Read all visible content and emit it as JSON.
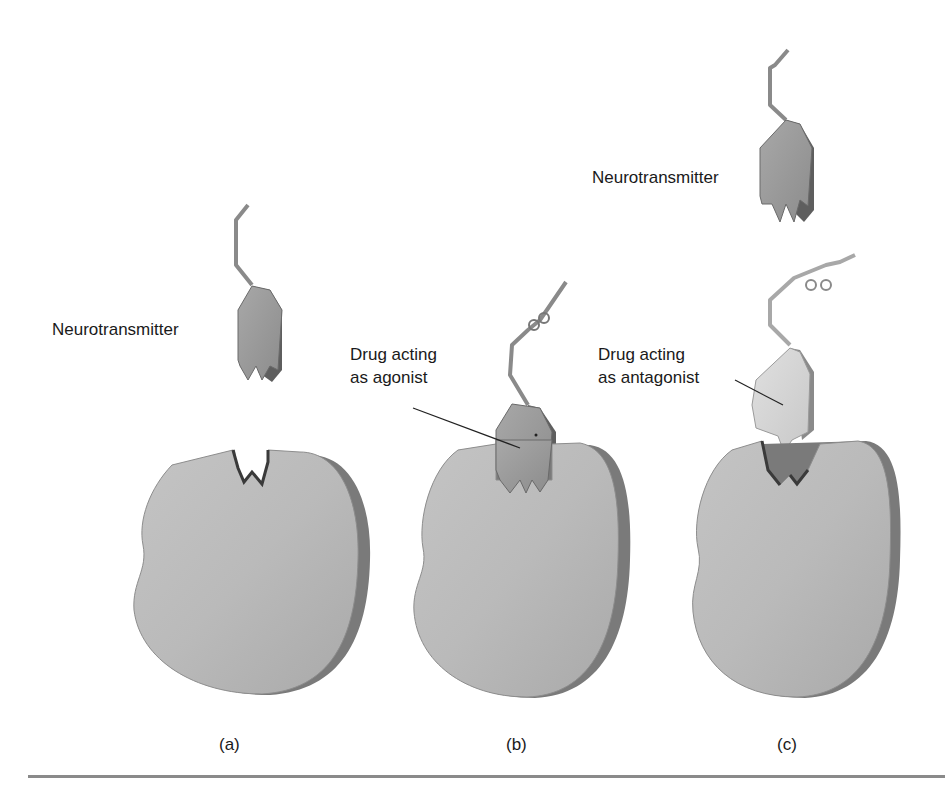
{
  "figure": {
    "panels": [
      {
        "id": "a",
        "panel_label": "(a)",
        "labels": {
          "neurotransmitter": "Neurotransmitter"
        }
      },
      {
        "id": "b",
        "panel_label": "(b)",
        "labels": {
          "drug_line1": "Drug acting",
          "drug_line2": "as agonist"
        }
      },
      {
        "id": "c",
        "panel_label": "(c)",
        "labels": {
          "neurotransmitter": "Neurotransmitter",
          "drug_line1": "Drug acting",
          "drug_line2": "as antagonist"
        }
      }
    ],
    "colors": {
      "receptor_fill": "#b9b9b9",
      "receptor_edge": "#6e6e6e",
      "neurotransmitter_fill": "#9a9a9a",
      "antagonist_fill": "#d6d6d6",
      "rule": "#8a8a8a"
    }
  }
}
